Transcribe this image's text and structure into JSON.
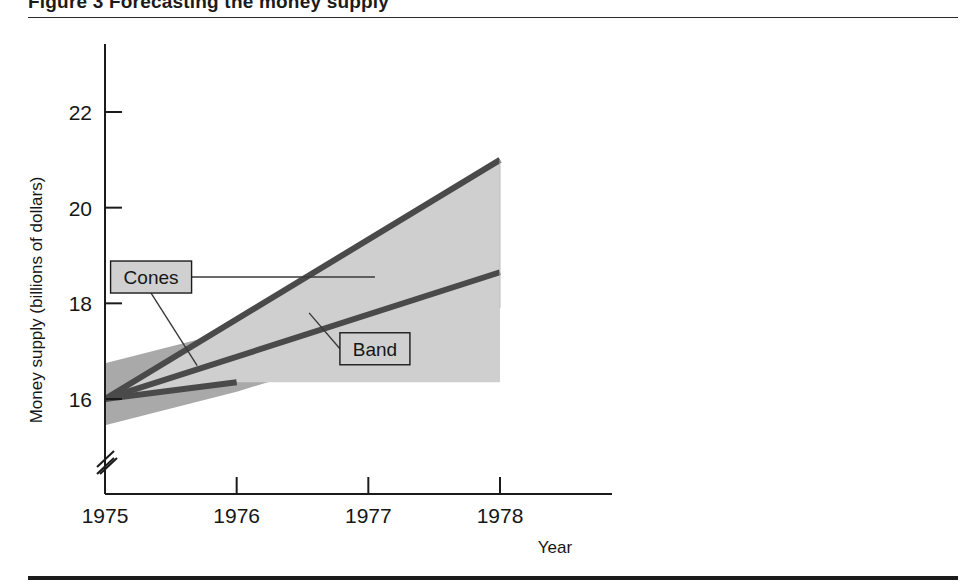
{
  "figure": {
    "caption_partial": "Figure 3  Forecasting the money supply",
    "top_rule": true,
    "bottom_rule": true
  },
  "chart_data": {
    "type": "area",
    "title": "",
    "xlabel": "Year",
    "ylabel": "Money supply (billions of dollars)",
    "xlim": [
      1975,
      1978.05
    ],
    "ylim": [
      15.2,
      22.9
    ],
    "xticks": [
      1975,
      1976,
      1977,
      1978
    ],
    "xticklabels": [
      "1975",
      "1976",
      "1977",
      "1978"
    ],
    "yticks": [
      16,
      18,
      20,
      22
    ],
    "yticklabels": [
      "16",
      "18",
      "20",
      "22"
    ],
    "y_axis_break": true,
    "x_axis_break": true,
    "grid": false,
    "legend": "none",
    "series": [
      {
        "name": "Cones",
        "kind": "cone",
        "description": "Fan-shaped forecast cone widening from the 1975 origin",
        "x": [
          1975,
          1976,
          1977,
          1978
        ],
        "upper": [
          16.0,
          17.65,
          19.35,
          21.0
        ],
        "lower": [
          16.0,
          16.35,
          16.35,
          16.35
        ],
        "fill_color": "#cfcfcf",
        "boundary_color": "#4a4a4a"
      },
      {
        "name": "Band",
        "kind": "band",
        "description": "Constant-width confidence band around the central forecast line",
        "x": [
          1975,
          1976,
          1977,
          1978
        ],
        "upper": [
          16.75,
          17.45,
          18.25,
          19.1
        ],
        "lower": [
          15.45,
          16.15,
          17.0,
          17.9
        ],
        "center": [
          16.0,
          16.85,
          17.75,
          18.65
        ],
        "fill_color": "#a9a9a9",
        "center_line_color": "#4a4a4a"
      }
    ],
    "annotations": [
      {
        "label": "Cones",
        "box_x": 1975.35,
        "box_y": 18.55,
        "leaders": 2,
        "leader_targets": [
          {
            "x": 1977.05,
            "y": 18.55
          },
          {
            "x": 1975.7,
            "y": 16.7
          }
        ]
      },
      {
        "label": "Band",
        "box_x": 1977.05,
        "box_y": 17.05,
        "leaders": 1,
        "leader_targets": [
          {
            "x": 1976.55,
            "y": 17.8
          }
        ]
      }
    ],
    "colors": {
      "cone_fill": "#cfcfcf",
      "band_fill": "#a9a9a9",
      "line": "#4a4a4a",
      "axis": "#1b1b1b",
      "text": "#161616",
      "callout_fill": "#d0d0d0",
      "callout_border": "#1b1b1b"
    }
  }
}
